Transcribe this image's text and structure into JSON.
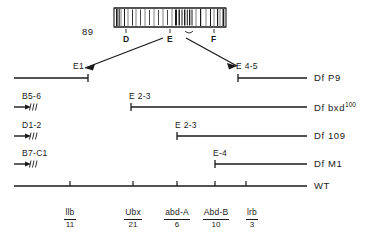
{
  "figure": {
    "chromosome": {
      "label_left": "89",
      "band_labels": [
        "D",
        "E",
        "F"
      ]
    },
    "rows": [
      {
        "segment_labels": [
          "E1",
          "E 4-5"
        ],
        "right_label": "Df P9",
        "right_label_sup": ""
      },
      {
        "left_label": "B5-6",
        "segment_labels": [
          "E 2-3"
        ],
        "right_label": "Df bxd",
        "right_label_sup": "100"
      },
      {
        "left_label": "D1-2",
        "segment_labels": [
          "E 2-3"
        ],
        "right_label": "Df 109",
        "right_label_sup": ""
      },
      {
        "left_label": "B7-C1",
        "segment_labels": [
          "E-4"
        ],
        "right_label": "Df M1",
        "right_label_sup": ""
      },
      {
        "segment_labels": [],
        "right_label": "WT",
        "right_label_sup": ""
      }
    ],
    "genes": [
      {
        "name": "llb",
        "number": "11"
      },
      {
        "name": "Ubx",
        "number": "21"
      },
      {
        "name": "abd-A",
        "number": "6"
      },
      {
        "name": "Abd-B",
        "number": "10"
      },
      {
        "name": "lrb",
        "number": "3"
      }
    ],
    "colors": {
      "ink": "#1a1a1a",
      "background": "#ffffff"
    }
  }
}
